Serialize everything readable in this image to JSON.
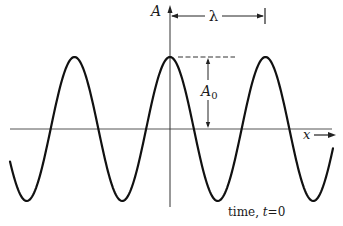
{
  "diagram": {
    "type": "sinusoidal wave snapshot",
    "labels": {
      "y_axis": "A",
      "x_axis": "x",
      "wavelength": "λ",
      "amplitude_main": "A",
      "amplitude_sub": "0",
      "caption_prefix": "time, ",
      "caption_var": "t",
      "caption_value": "=0"
    },
    "colors": {
      "curve": "#111111",
      "axis": "#444444",
      "background": "#ffffff"
    },
    "geometry": {
      "axis_y_px": 129,
      "origin_x_px": 170,
      "amplitude_px": 72,
      "wavelength_px": 95.5,
      "peaks_x_px": [
        75,
        170,
        265
      ],
      "troughs_x_px": [
        29,
        122,
        217,
        313
      ]
    }
  }
}
